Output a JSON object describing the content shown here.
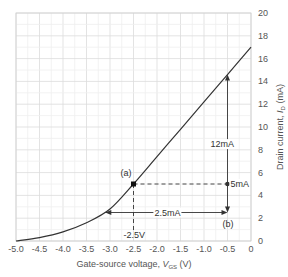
{
  "chart_data": {
    "type": "line",
    "title": "",
    "xlabel": "Gate-source voltage, V_GS (V)",
    "ylabel": "Drain current, I_D (mA)",
    "xlim": [
      -5.0,
      0
    ],
    "ylim": [
      0,
      20
    ],
    "grid": true,
    "x_ticks": [
      "-5.0",
      "-4.5",
      "-4.0",
      "-3.5",
      "-3.0",
      "-2.5",
      "-2.0",
      "-1.5",
      "-1.0",
      "-0.5",
      "0"
    ],
    "y_ticks": [
      "0",
      "2",
      "4",
      "6",
      "8",
      "10",
      "12",
      "14",
      "16",
      "18",
      "20"
    ],
    "series": [
      {
        "name": "Transfer characteristic",
        "x": [
          -5.0,
          -4.5,
          -4.0,
          -3.5,
          -3.0,
          -2.5,
          -2.0,
          -1.5,
          -1.0,
          -0.5,
          0
        ],
        "y": [
          0.0,
          0.3,
          0.8,
          1.6,
          2.8,
          5.0,
          7.4,
          9.8,
          12.2,
          14.6,
          17.0
        ]
      }
    ],
    "annotations": [
      {
        "label": "(a)",
        "x": -2.5,
        "y": 5.0
      },
      {
        "label": "(b)",
        "x": -0.5,
        "y": 2.5
      },
      {
        "label": "-2.5V",
        "x": -2.5,
        "y": 0
      },
      {
        "label": "2.5mA",
        "desc": "horizontal arrow from curve to (b) at 2.5mA"
      },
      {
        "label": "5mA",
        "desc": "dashed line from (a) to x=-0.5 at 5mA"
      },
      {
        "label": "12mA",
        "desc": "vertical arrow at x=-0.5 up to curve"
      }
    ]
  },
  "labels": {
    "xlabel_main": "Gate-source voltage, ",
    "xlabel_var": "V",
    "xlabel_sub": "GS",
    "xlabel_unit": " (V)",
    "ylabel_main": "Drain current, ",
    "ylabel_var": "I",
    "ylabel_sub": "D",
    "ylabel_unit": " (mA)",
    "point_a": "(a)",
    "point_b": "(b)",
    "vgs_mark": "-2.5V",
    "current_25": "2.5mA",
    "current_5": "5mA",
    "current_12": "12mA"
  }
}
